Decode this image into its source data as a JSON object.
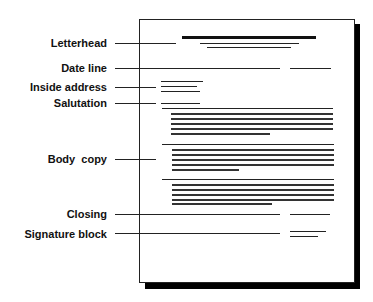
{
  "diagram": {
    "labels": [
      {
        "key": "letterhead",
        "text": "Letterhead",
        "y": 37
      },
      {
        "key": "date_line",
        "text": "Date line",
        "y": 62
      },
      {
        "key": "inside_address",
        "text": "Inside address",
        "y": 81
      },
      {
        "key": "salutation",
        "text": "Salutation",
        "y": 97
      },
      {
        "key": "body_copy",
        "text": "Body  copy",
        "y": 153
      },
      {
        "key": "closing",
        "text": "Closing",
        "y": 208
      },
      {
        "key": "signature_block",
        "text": "Signature block",
        "y": 228
      }
    ]
  }
}
